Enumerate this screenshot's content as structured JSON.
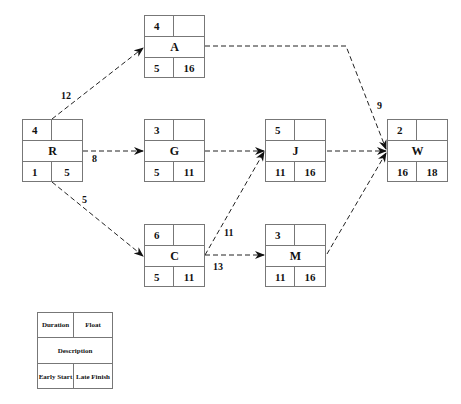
{
  "nodes": {
    "R": {
      "description": "R",
      "duration": "4",
      "float": "",
      "early_start": "1",
      "late_finish": "5"
    },
    "A": {
      "description": "A",
      "duration": "4",
      "float": "",
      "early_start": "5",
      "late_finish": "16"
    },
    "G": {
      "description": "G",
      "duration": "3",
      "float": "",
      "early_start": "5",
      "late_finish": "11"
    },
    "C": {
      "description": "C",
      "duration": "6",
      "float": "",
      "early_start": "5",
      "late_finish": "11"
    },
    "J": {
      "description": "J",
      "duration": "5",
      "float": "",
      "early_start": "11",
      "late_finish": "16"
    },
    "M": {
      "description": "M",
      "duration": "3",
      "float": "",
      "early_start": "11",
      "late_finish": "16"
    },
    "W": {
      "description": "W",
      "duration": "2",
      "float": "",
      "early_start": "16",
      "late_finish": "18"
    }
  },
  "edges": {
    "R_A": {
      "from": "R",
      "to": "A",
      "label": "12"
    },
    "R_G": {
      "from": "R",
      "to": "G",
      "label": "8"
    },
    "R_C": {
      "from": "R",
      "to": "C",
      "label": "5"
    },
    "A_W": {
      "from": "A",
      "to": "W",
      "label": "9"
    },
    "G_J": {
      "from": "G",
      "to": "J",
      "label": ""
    },
    "C_J": {
      "from": "C",
      "to": "J",
      "label": "11"
    },
    "C_M": {
      "from": "C",
      "to": "M",
      "label": "13"
    },
    "J_W": {
      "from": "J",
      "to": "W",
      "label": ""
    },
    "M_W": {
      "from": "M",
      "to": "W",
      "label": ""
    }
  },
  "legend": {
    "duration": "Duration",
    "float": "Float",
    "description": "Description",
    "early_start": "Early Start",
    "late_finish": "Late Finish"
  },
  "style": {
    "line_color": "#222222",
    "border_color": "#777777"
  }
}
